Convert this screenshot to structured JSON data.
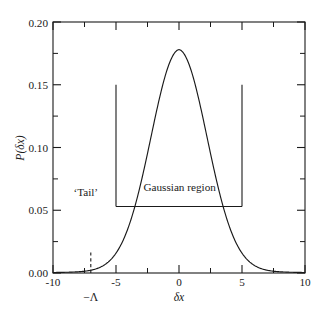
{
  "chart_data": {
    "type": "line",
    "title": "",
    "xlabel": "δx",
    "ylabel": "P(δx)",
    "xlim": [
      -10,
      10
    ],
    "ylim": [
      0.0,
      0.2
    ],
    "grid": false,
    "legend": null,
    "x_ticks": [
      -10,
      -5,
      0,
      5,
      10
    ],
    "x_tick_labels": [
      "-10",
      "-5",
      "0",
      "5",
      "10"
    ],
    "x_minor_ticks": [
      -7.5,
      -2.5,
      2.5,
      7.5
    ],
    "y_ticks": [
      0.0,
      0.05,
      0.1,
      0.15,
      0.2
    ],
    "y_tick_labels": [
      "0.00",
      "0.05",
      "0.10",
      "0.15",
      "0.20"
    ],
    "y_minor_ticks": [
      0.025,
      0.075,
      0.125,
      0.175
    ],
    "series": [
      {
        "name": "P(δx)",
        "style": "solid",
        "color": "#1a1a1a",
        "peak_value": 0.178,
        "peak_x": 0,
        "sigma": 2.24,
        "x": [
          -10,
          -9.5,
          -9,
          -8.5,
          -8,
          -7.5,
          -7,
          -6.5,
          -6,
          -5.5,
          -5,
          -4.5,
          -4,
          -3.5,
          -3,
          -2.5,
          -2,
          -1.5,
          -1,
          -0.5,
          0,
          0.5,
          1,
          1.5,
          2,
          2.5,
          3,
          3.5,
          4,
          4.5,
          5,
          5.5,
          6,
          6.5,
          7,
          7.5,
          8,
          8.5,
          9,
          9.5,
          10
        ],
        "y": [
          0.0015,
          0.0022,
          0.0032,
          0.0046,
          0.0066,
          0.0094,
          0.0132,
          0.0183,
          0.025,
          0.0336,
          0.0532,
          0.0686,
          0.0868,
          0.1073,
          0.1287,
          0.1495,
          0.1672,
          0.1774,
          0.1778,
          0.1778,
          0.1778,
          0.1778,
          0.1778,
          0.1774,
          0.1672,
          0.1495,
          0.1287,
          0.1073,
          0.0868,
          0.0686,
          0.0532,
          0.0336,
          0.025,
          0.0183,
          0.0132,
          0.0094,
          0.0066,
          0.0046,
          0.0032,
          0.0022,
          0.0015
        ]
      }
    ],
    "markers": [
      {
        "id": "left-boundary",
        "type": "vline",
        "x": -5,
        "y_from": 0.053,
        "y_to": 0.15,
        "style": "solid"
      },
      {
        "id": "right-boundary",
        "type": "vline",
        "x": 5,
        "y_from": 0.053,
        "y_to": 0.15,
        "style": "solid"
      },
      {
        "id": "gaussian-span",
        "type": "hline",
        "y": 0.053,
        "x_from": -5,
        "x_to": 5,
        "style": "solid"
      },
      {
        "id": "lambda-cutoff",
        "type": "vline",
        "x": -7,
        "y_from": 0.0,
        "y_to": 0.0185,
        "style": "dashed"
      }
    ],
    "annotations": [
      {
        "id": "tail-label",
        "text": "‘Tail’",
        "x": -7.4,
        "y": 0.0615
      },
      {
        "id": "gaussian-region-label",
        "text": "Gaussian region",
        "x": 0.05,
        "y": 0.0655
      },
      {
        "id": "lambda-tick-label",
        "text": "−Λ",
        "x": -7,
        "y": -0.0225
      }
    ]
  }
}
